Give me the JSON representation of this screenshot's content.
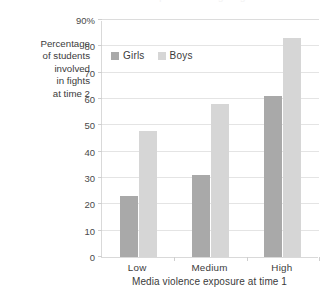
{
  "figure": {
    "width": 326,
    "height": 291,
    "background": "#ffffff",
    "clipped_top_text": "Media violence exposure and fighting"
  },
  "y_axis_title_lines": [
    "Percentage",
    "of students",
    "involved",
    "in fights",
    "at time 2"
  ],
  "legend": {
    "entries": [
      {
        "label": "Girls",
        "color": "#a9a9a9"
      },
      {
        "label": "Boys",
        "color": "#d6d6d6"
      }
    ]
  },
  "chart_data": {
    "type": "bar",
    "title": "",
    "subtitle": "",
    "xlabel": "Media violence exposure at time 1",
    "ylabel": "Percentage of students involved in fights at time 2",
    "categories": [
      "Low",
      "Medium",
      "High"
    ],
    "series": [
      {
        "name": "Girls",
        "color": "#a9a9a9",
        "values": [
          23,
          31,
          61
        ]
      },
      {
        "name": "Boys",
        "color": "#d6d6d6",
        "values": [
          48,
          58,
          83
        ]
      }
    ],
    "ylim": [
      0,
      90
    ],
    "ytick_step": 10,
    "ytick_labels": [
      "0",
      "10",
      "20",
      "30",
      "40",
      "50",
      "60",
      "70",
      "80",
      "90%"
    ],
    "ytick_values": [
      0,
      10,
      20,
      30,
      40,
      50,
      60,
      70,
      80,
      90
    ],
    "grid": "horizontal",
    "legend_position": "inside top-left",
    "value_unit": "percent"
  }
}
